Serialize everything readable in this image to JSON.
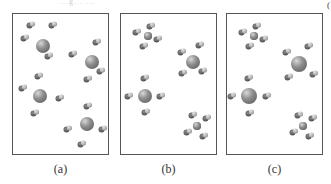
{
  "figure": {
    "top_caption_fragment": "...g... ...",
    "top_right_mark": "(",
    "panels": [
      {
        "id": "a",
        "label": "(a)",
        "description": "Four large central atoms each surrounded by four small separate diatomic-looking molecules (not bonded)",
        "clusters": [
          {
            "center": [
              30,
              32
            ],
            "r": 7,
            "ligands": [
              [
                18,
                11
              ],
              [
                40,
                11
              ],
              [
                12,
                24
              ],
              [
                36,
                42
              ]
            ],
            "bonded": false
          },
          {
            "center": [
              79,
              48
            ],
            "r": 7,
            "ligands": [
              [
                84,
                28
              ],
              [
                60,
                40
              ],
              [
                88,
                57
              ],
              [
                75,
                65
              ]
            ],
            "bonded": false
          },
          {
            "center": [
              27,
              82
            ],
            "r": 7,
            "ligands": [
              [
                26,
                62
              ],
              [
                10,
                74
              ],
              [
                47,
                84
              ],
              [
                22,
                99
              ]
            ],
            "bonded": false
          },
          {
            "center": [
              74,
              110
            ],
            "r": 7,
            "ligands": [
              [
                75,
                92
              ],
              [
                55,
                115
              ],
              [
                90,
                115
              ],
              [
                69,
                130
              ]
            ],
            "bonded": false
          }
        ]
      },
      {
        "id": "b",
        "label": "(b)",
        "description": "Two small central atoms with four bonded ligands, two large central atoms with four nearby ligands",
        "clusters": [
          {
            "center": [
              27,
              22
            ],
            "r": 4,
            "ligands": [
              [
                30,
                12
              ],
              [
                16,
                18
              ],
              [
                37,
                25
              ],
              [
                23,
                32
              ]
            ],
            "bonded": true
          },
          {
            "center": [
              72,
              48
            ],
            "r": 7,
            "ligands": [
              [
                61,
                38
              ],
              [
                79,
                31
              ],
              [
                62,
                59
              ],
              [
                82,
                57
              ]
            ],
            "bonded": false
          },
          {
            "center": [
              24,
              82
            ],
            "r": 7,
            "ligands": [
              [
                24,
                64
              ],
              [
                8,
                82
              ],
              [
                40,
                82
              ],
              [
                25,
                98
              ]
            ],
            "bonded": false
          },
          {
            "center": [
              76,
              112
            ],
            "r": 4,
            "ligands": [
              [
                72,
                101
              ],
              [
                86,
                104
              ],
              [
                67,
                118
              ],
              [
                83,
                122
              ]
            ],
            "bonded": true
          }
        ]
      },
      {
        "id": "c",
        "label": "(c)",
        "description": "Two small central atoms with four bonded ligands, two large central atoms with four nearby ligands",
        "clusters": [
          {
            "center": [
              27,
              22
            ],
            "r": 4,
            "ligands": [
              [
                30,
                12
              ],
              [
                16,
                18
              ],
              [
                37,
                25
              ],
              [
                23,
                32
              ]
            ],
            "bonded": true
          },
          {
            "center": [
              72,
              50
            ],
            "r": 8,
            "ligands": [
              [
                60,
                38
              ],
              [
                82,
                32
              ],
              [
                62,
                63
              ],
              [
                87,
                60
              ]
            ],
            "bonded": false
          },
          {
            "center": [
              22,
              82
            ],
            "r": 8,
            "ligands": [
              [
                22,
                64
              ],
              [
                5,
                82
              ],
              [
                40,
                82
              ],
              [
                23,
                99
              ]
            ],
            "bonded": false
          },
          {
            "center": [
              76,
              112
            ],
            "r": 4,
            "ligands": [
              [
                72,
                101
              ],
              [
                86,
                104
              ],
              [
                67,
                118
              ],
              [
                83,
                122
              ]
            ],
            "bonded": true
          }
        ]
      }
    ],
    "colors": {
      "frame": "#555555",
      "central_atom": "#8f8f8f",
      "central_highlight": "#d8d8d8",
      "ligand_dark": "#4a4a4a",
      "ligand_light": "#e6e6e6",
      "label_text": "#333333"
    }
  }
}
